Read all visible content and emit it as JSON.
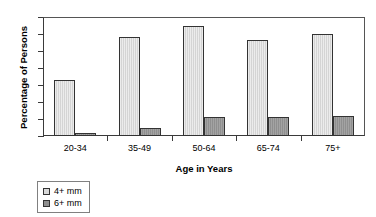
{
  "chart_data": {
    "type": "bar",
    "title": "",
    "subtitle": "",
    "xlabel": "Age in Years",
    "ylabel": "Percentage of Persons",
    "categories": [
      "20-34",
      "35-49",
      "50-64",
      "65-74",
      "75+"
    ],
    "series": [
      {
        "name": "4+ mm",
        "color": "#d9d9d9",
        "values": [
          6.6,
          11.7,
          13.0,
          11.3,
          12.0
        ]
      },
      {
        "name": "6+ mm",
        "color": "#8f8f8f",
        "values": [
          0.3,
          0.9,
          2.2,
          2.2,
          2.3
        ]
      }
    ],
    "ylim": [
      0,
      14
    ],
    "yticks": [
      0,
      2,
      4,
      6,
      8,
      10,
      12,
      14
    ],
    "ytick_labels": [
      "0",
      "2",
      "4",
      "6",
      "8",
      "10",
      "12",
      "14"
    ],
    "grid": false,
    "legend_position": "below-left",
    "legend_entries": [
      "4+ mm",
      "6+ mm"
    ]
  }
}
